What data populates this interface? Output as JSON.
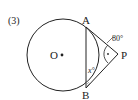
{
  "problem_number": "(3)",
  "labels": {
    "A": "A",
    "B": "B",
    "O": "O",
    "P": "P",
    "angle_P": "80°",
    "angle_x": "x°"
  },
  "colors": {
    "stroke": "#222222",
    "background": "#ffffff"
  }
}
